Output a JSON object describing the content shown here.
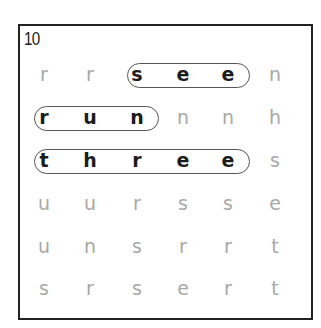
{
  "puzzle": {
    "number": "10",
    "grid": [
      [
        "r",
        "r",
        "s",
        "e",
        "e",
        "n"
      ],
      [
        "r",
        "u",
        "n",
        "n",
        "n",
        "h"
      ],
      [
        "t",
        "h",
        "r",
        "e",
        "e",
        "s"
      ],
      [
        "u",
        "u",
        "r",
        "s",
        "s",
        "e"
      ],
      [
        "u",
        "n",
        "s",
        "r",
        "r",
        "t"
      ],
      [
        "s",
        "r",
        "s",
        "e",
        "r",
        "t"
      ]
    ],
    "found_words": [
      {
        "word": "see",
        "row": 0,
        "start_col": 2,
        "end_col": 4
      },
      {
        "word": "run",
        "row": 1,
        "start_col": 0,
        "end_col": 2
      },
      {
        "word": "three",
        "row": 2,
        "start_col": 0,
        "end_col": 4
      }
    ],
    "colors": {
      "border": "#222222",
      "unfound_letter": "#a8a8a8",
      "found_letter": "#1c1c1c",
      "pill_outline": "#555555"
    }
  }
}
